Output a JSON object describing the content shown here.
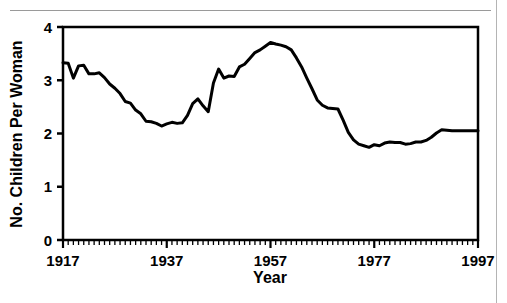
{
  "page": {
    "background_color": "#ffffff",
    "rule_color": "#9a9a9a"
  },
  "chart_data": {
    "type": "line",
    "title": "",
    "subtitle": "",
    "xlabel": "Year",
    "ylabel": "No. Children Per Woman",
    "xlim": [
      1917,
      1997
    ],
    "ylim": [
      0,
      4
    ],
    "x_tick_labels": [
      "1917",
      "1937",
      "1957",
      "1977",
      "1997"
    ],
    "x_tick_values": [
      1917,
      1937,
      1957,
      1977,
      1997
    ],
    "x_minor_tick_step": 1,
    "y_tick_labels": [
      "0",
      "1",
      "2",
      "3",
      "4"
    ],
    "y_tick_values": [
      0,
      1,
      2,
      3,
      4
    ],
    "grid": false,
    "legend": false,
    "line_color": "#000000",
    "line_width": 3,
    "series": [
      {
        "name": "Total fertility rate",
        "x": [
          1917,
          1918,
          1919,
          1920,
          1921,
          1922,
          1923,
          1924,
          1925,
          1926,
          1927,
          1928,
          1929,
          1930,
          1931,
          1932,
          1933,
          1934,
          1935,
          1936,
          1937,
          1938,
          1939,
          1940,
          1941,
          1942,
          1943,
          1944,
          1945,
          1946,
          1947,
          1948,
          1949,
          1950,
          1951,
          1952,
          1953,
          1954,
          1955,
          1956,
          1957,
          1958,
          1959,
          1960,
          1961,
          1962,
          1963,
          1964,
          1965,
          1966,
          1967,
          1968,
          1969,
          1970,
          1971,
          1972,
          1973,
          1974,
          1975,
          1976,
          1977,
          1978,
          1979,
          1980,
          1981,
          1982,
          1983,
          1984,
          1985,
          1986,
          1987,
          1988,
          1989,
          1990,
          1991,
          1992,
          1993,
          1994,
          1995,
          1996,
          1997
        ],
        "values": [
          3.33,
          3.32,
          3.04,
          3.27,
          3.28,
          3.12,
          3.12,
          3.14,
          3.05,
          2.93,
          2.85,
          2.75,
          2.6,
          2.57,
          2.44,
          2.37,
          2.23,
          2.22,
          2.19,
          2.14,
          2.18,
          2.21,
          2.19,
          2.2,
          2.34,
          2.56,
          2.65,
          2.52,
          2.41,
          2.95,
          3.21,
          3.04,
          3.08,
          3.07,
          3.25,
          3.3,
          3.41,
          3.52,
          3.57,
          3.64,
          3.71,
          3.68,
          3.66,
          3.63,
          3.57,
          3.42,
          3.25,
          3.04,
          2.84,
          2.63,
          2.53,
          2.48,
          2.47,
          2.46,
          2.25,
          2.02,
          1.88,
          1.8,
          1.77,
          1.74,
          1.79,
          1.77,
          1.82,
          1.84,
          1.83,
          1.83,
          1.8,
          1.81,
          1.84,
          1.84,
          1.87,
          1.93,
          2.01,
          2.07,
          2.06,
          2.05,
          2.05,
          2.05,
          2.05,
          2.05,
          2.05
        ]
      }
    ]
  }
}
